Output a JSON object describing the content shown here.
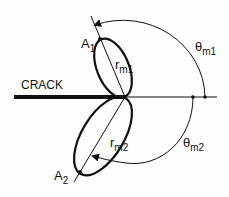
{
  "diagram": {
    "crack_label": "CRACK",
    "points": {
      "a1": {
        "main": "A",
        "sub": "1"
      },
      "a2": {
        "main": "A",
        "sub": "2"
      }
    },
    "radii": {
      "r1": {
        "main": "r",
        "sub": "m1"
      },
      "r2": {
        "main": "r",
        "sub": "m2"
      }
    },
    "angles": {
      "t1": {
        "main": "θ",
        "sub": "m1"
      },
      "t2": {
        "main": "θ",
        "sub": "m2"
      }
    },
    "stroke_color": "#111111"
  }
}
